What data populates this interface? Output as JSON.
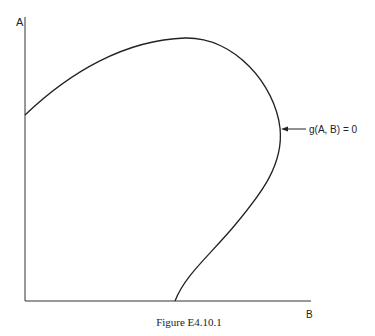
{
  "figure": {
    "caption": "Figure E4.10.1",
    "axes": {
      "y_label": "A",
      "x_label": "B"
    },
    "curve": {
      "annotation": "g(A, B) = 0"
    },
    "colors": {
      "line": "#222222",
      "background": "#ffffff"
    }
  }
}
